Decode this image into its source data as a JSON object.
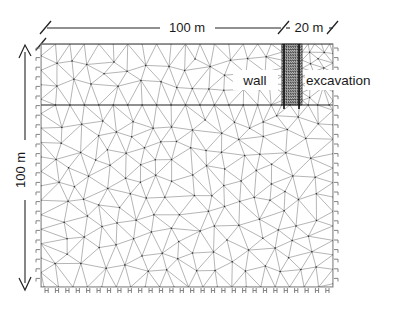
{
  "figure": {
    "kind": "finite-element-mesh",
    "background_color": "#ffffff",
    "mesh_color": "#5a5a5a",
    "node_color": "#2b2b2b",
    "text_color": "#1a1a1a"
  },
  "dimensions": {
    "top_left": {
      "label": "100 m",
      "value": 100,
      "unit": "m",
      "orientation": "horizontal"
    },
    "top_right": {
      "label": "20 m",
      "value": 20,
      "unit": "m",
      "orientation": "horizontal"
    },
    "left": {
      "label": "100 m",
      "value": 100,
      "unit": "m",
      "orientation": "vertical"
    }
  },
  "annotations": [
    {
      "name": "wall",
      "label": "wall"
    },
    {
      "name": "excavation",
      "label": "excavation"
    }
  ],
  "chart_data": {
    "type": "diagram",
    "title": "",
    "xlabel": "",
    "ylabel": "",
    "domain_width_m": 120,
    "domain_height_m": 100,
    "regions": [
      {
        "name": "soil-domain",
        "width_m": 120,
        "height_m": 100
      },
      {
        "name": "retained-soil",
        "width_m": 100,
        "height_m": 100
      },
      {
        "name": "excavation",
        "width_m": 20,
        "height_m": 20
      }
    ],
    "boundary_conditions": [
      {
        "edge": "left",
        "type": "roller"
      },
      {
        "edge": "right",
        "type": "roller"
      },
      {
        "edge": "bottom",
        "type": "fixed"
      },
      {
        "edge": "top",
        "type": "free"
      }
    ],
    "mesh": {
      "element_type": "triangular",
      "refinement": "graded-toward-wall"
    }
  }
}
